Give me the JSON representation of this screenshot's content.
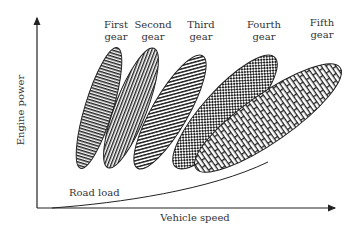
{
  "diagram": {
    "axes": {
      "y_label": "Engine power",
      "x_label": "Vehicle speed"
    },
    "curve_label": "Road load",
    "gears": [
      {
        "line1": "First",
        "line2": "gear",
        "pattern": "horizontal-lines"
      },
      {
        "line1": "Second",
        "line2": "gear",
        "pattern": "vertical-lines"
      },
      {
        "line1": "Third",
        "line2": "gear",
        "pattern": "diagonal-lines"
      },
      {
        "line1": "Fourth",
        "line2": "gear",
        "pattern": "checkerboard"
      },
      {
        "line1": "Fifth",
        "line2": "gear",
        "pattern": "brick"
      }
    ],
    "colors": {
      "stroke": "#1a1a1a",
      "background": "#ffffff"
    }
  }
}
